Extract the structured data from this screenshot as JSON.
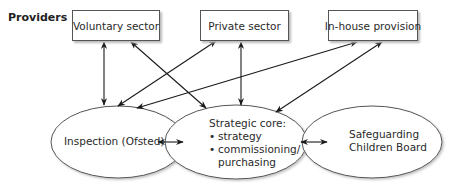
{
  "diagram": {
    "providers_label": "Providers",
    "providers": [
      {
        "id": "voluntary",
        "label": "Voluntary sector"
      },
      {
        "id": "private",
        "label": "Private sector"
      },
      {
        "id": "inhouse",
        "label": "In-house provision"
      }
    ],
    "nodes": {
      "inspection": {
        "label": "Inspection (Ofsted)"
      },
      "strategic_core": {
        "title": "Strategic core:",
        "bullets": [
          "strategy",
          "commissioning/",
          "purchasing"
        ],
        "bullet_glyph": "•"
      },
      "safeguarding": {
        "line1": "Safeguarding",
        "line2": "Children Board"
      }
    },
    "edges": [
      {
        "from": "voluntary",
        "to": "inspection",
        "type": "bidirectional"
      },
      {
        "from": "voluntary",
        "to": "strategic_core",
        "type": "bidirectional"
      },
      {
        "from": "private",
        "to": "inspection",
        "type": "bidirectional"
      },
      {
        "from": "private",
        "to": "strategic_core",
        "type": "bidirectional"
      },
      {
        "from": "inhouse",
        "to": "inspection",
        "type": "bidirectional"
      },
      {
        "from": "inhouse",
        "to": "strategic_core",
        "type": "bidirectional"
      },
      {
        "from": "inspection",
        "to": "strategic_core",
        "type": "bidirectional"
      },
      {
        "from": "strategic_core",
        "to": "safeguarding",
        "type": "bidirectional"
      }
    ],
    "colors": {
      "line": "#1a1a1a",
      "border": "#555555",
      "shadow": "#bbbbbb"
    }
  }
}
